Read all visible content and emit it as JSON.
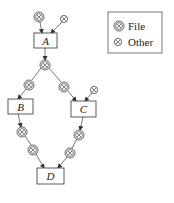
{
  "diagram": {
    "nodes": {
      "A": {
        "label": "A"
      },
      "B": {
        "label": "B"
      },
      "C": {
        "label": "C"
      },
      "D": {
        "label": "D"
      }
    },
    "legend": {
      "items": [
        {
          "symbol": "file-icon",
          "label": "File"
        },
        {
          "symbol": "other-icon",
          "label": "Other"
        }
      ]
    },
    "edges": [
      {
        "from": "file-1",
        "to": "A"
      },
      {
        "from": "other-1",
        "to": "A"
      },
      {
        "from": "A",
        "to": "file-2"
      },
      {
        "from": "file-2",
        "to": "file-3"
      },
      {
        "from": "file-2",
        "to": "file-4"
      },
      {
        "from": "file-3",
        "to": "B"
      },
      {
        "from": "file-4",
        "to": "C"
      },
      {
        "from": "other-2",
        "to": "C"
      },
      {
        "from": "B",
        "to": "file-5"
      },
      {
        "from": "file-5",
        "to": "file-6"
      },
      {
        "from": "file-6",
        "to": "D"
      },
      {
        "from": "C",
        "to": "file-7"
      },
      {
        "from": "file-7",
        "to": "file-8"
      },
      {
        "from": "file-8",
        "to": "D"
      }
    ],
    "colors": {
      "stroke": "#333333",
      "fill": "#ffffff"
    }
  }
}
